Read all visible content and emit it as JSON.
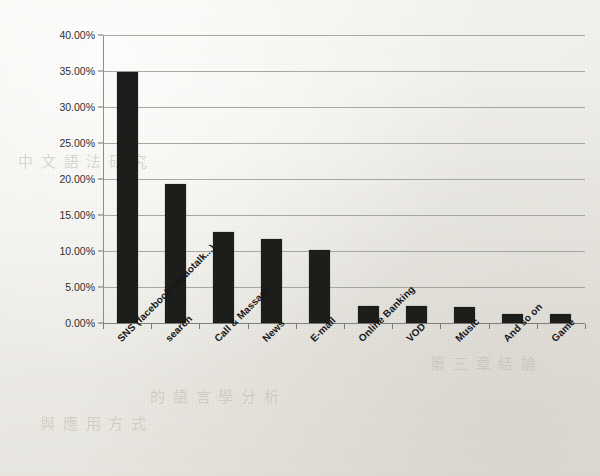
{
  "chart_data": {
    "type": "bar",
    "title": "",
    "subtitle": "",
    "xlabel": "",
    "ylabel": "",
    "ylim": [
      0,
      40
    ],
    "ytick_labels": [
      "0.00%",
      "5.00%",
      "10.00%",
      "15.00%",
      "20.00%",
      "25.00%",
      "30.00%",
      "35.00%",
      "40.00%"
    ],
    "ytick_values": [
      0,
      5,
      10,
      15,
      20,
      25,
      30,
      35,
      40
    ],
    "grid": "horizontal",
    "legend": "none",
    "bar_color": "#1d1d1b",
    "categories": [
      "SNS (facebook,kakaotalk...)",
      "search",
      "Call & Massage",
      "News",
      "E-mail",
      "Online Banking",
      "VOD",
      "Music",
      "And so on",
      "Game"
    ],
    "values": [
      34.8,
      19.3,
      12.7,
      11.6,
      10.1,
      2.3,
      2.3,
      2.2,
      1.3,
      1.2
    ],
    "value_unit": "%"
  },
  "page": {
    "bleed_text": [
      "中 文 語 法 研 究",
      "的 語 言 學 分 析",
      "與 應 用 方 式",
      "第 三 章 結 論"
    ]
  }
}
